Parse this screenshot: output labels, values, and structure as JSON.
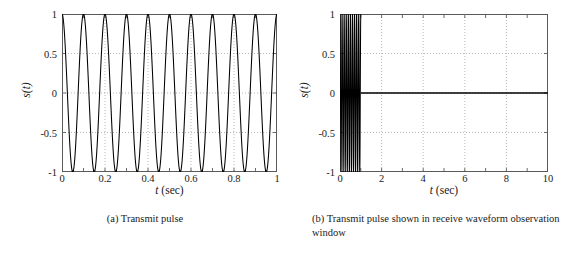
{
  "figure": {
    "background": "#ffffff",
    "line_color": "#000000",
    "grid_color": "#9a9a9a",
    "axis_color": "#5a5a5a"
  },
  "panels": [
    {
      "id": "panel-a",
      "caption": "(a) Transmit pulse",
      "xlabel_symbol": "t",
      "xlabel_unit": "(sec)",
      "ylabel": "s(t)",
      "xticklabels": [
        "0",
        "0.2",
        "0.4",
        "0.6",
        "0.8",
        "1"
      ],
      "xtickvalues": [
        0,
        0.2,
        0.4,
        0.6,
        0.8,
        1
      ],
      "xminorticks": [
        0.1,
        0.3,
        0.5,
        0.7,
        0.9
      ],
      "yticklabels": [
        "1",
        "0.5",
        "0",
        "-0.5",
        "-1"
      ],
      "ytickvalues": [
        1,
        0.5,
        0,
        -0.5,
        -1
      ]
    },
    {
      "id": "panel-b",
      "caption": "(b) Transmit pulse shown in receive waveform observation window",
      "xlabel_symbol": "t",
      "xlabel_unit": "(sec)",
      "ylabel": "s(t)",
      "xticklabels": [
        "0",
        "2",
        "4",
        "6",
        "8",
        "10"
      ],
      "xtickvalues": [
        0,
        2,
        4,
        6,
        8,
        10
      ],
      "xminorticks": [
        1,
        3,
        5,
        7,
        9
      ],
      "yticklabels": [
        "1",
        "0.5",
        "0",
        "-0.5",
        "-1"
      ],
      "ytickvalues": [
        1,
        0.5,
        0,
        -0.5,
        -1
      ]
    }
  ],
  "chart_data": [
    {
      "type": "line",
      "title": "(a) Transmit pulse",
      "xlabel": "t (sec)",
      "ylabel": "s(t)",
      "xlim": [
        0,
        1
      ],
      "ylim": [
        -1,
        1
      ],
      "grid": true,
      "legend": null,
      "waveform": {
        "expression": "s(t) = cos(2*pi*10*t)",
        "amplitude": 1,
        "frequency_hz": 10,
        "phase": 0,
        "t_start": 0,
        "t_end": 1,
        "cycles": 10
      },
      "xticks": [
        0,
        0.2,
        0.4,
        0.6,
        0.8,
        1
      ],
      "xticklabels": [
        "0",
        "0.2",
        "0.4",
        "0.6",
        "0.8",
        "1"
      ],
      "yticks": [
        -1,
        -0.5,
        0,
        0.5,
        1
      ],
      "yticklabels": [
        "-1",
        "-0.5",
        "0",
        "0.5",
        "1"
      ]
    },
    {
      "type": "line",
      "title": "(b) Transmit pulse shown in receive waveform observation window",
      "xlabel": "t (sec)",
      "ylabel": "s(t)",
      "xlim": [
        0,
        10
      ],
      "ylim": [
        -1,
        1
      ],
      "grid": true,
      "legend": null,
      "waveform": {
        "expression": "s(t) = cos(2*pi*10*t) for 0<=t<=1, else 0",
        "amplitude": 1,
        "frequency_hz": 10,
        "phase": 0,
        "pulse_start": 0,
        "pulse_end": 1,
        "cycles": 10,
        "zero_from": 1,
        "zero_to": 10
      },
      "xticks": [
        0,
        2,
        4,
        6,
        8,
        10
      ],
      "xticklabels": [
        "0",
        "2",
        "4",
        "6",
        "8",
        "10"
      ],
      "yticks": [
        -1,
        -0.5,
        0,
        0.5,
        1
      ],
      "yticklabels": [
        "-1",
        "-0.5",
        "0",
        "0.5",
        "1"
      ]
    }
  ]
}
